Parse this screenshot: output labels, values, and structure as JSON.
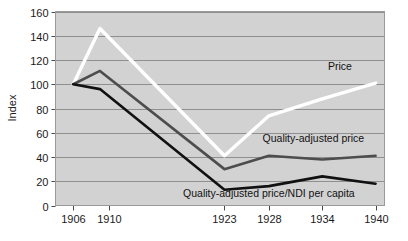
{
  "chart_data": {
    "type": "line",
    "title": "",
    "subtitle": "",
    "xlabel": "",
    "ylabel": "Index",
    "x": [
      1906,
      1910,
      1923,
      1928,
      1934,
      1940
    ],
    "xtick_labels": [
      "1906",
      "1910",
      "1923",
      "1928",
      "1934",
      "1940"
    ],
    "ytick_labels": [
      "0",
      "20",
      "40",
      "60",
      "80",
      "100",
      "120",
      "140",
      "160"
    ],
    "yticks": [
      0,
      20,
      40,
      60,
      80,
      100,
      120,
      140,
      160
    ],
    "xlim": [
      1904,
      1941
    ],
    "ylim": [
      0,
      160
    ],
    "grid": "horizontal",
    "legend_position": "inline-annotations",
    "plot_background": "#d2d2d2",
    "figure_background": "#ffffff",
    "series": [
      {
        "name": "Price",
        "color": "#ffffff",
        "values": [
          100,
          146,
          41,
          74,
          88,
          101
        ],
        "peak_x": 1909,
        "annotation": "Price"
      },
      {
        "name": "Quality-adjusted price",
        "color": "#4d4d4d",
        "values": [
          100,
          111,
          30,
          41,
          38,
          41
        ],
        "peak_x": 1909,
        "annotation": "Quality-adjusted price"
      },
      {
        "name": "Quality-adjusted price/NDI per capita",
        "color": "#111111",
        "values": [
          100,
          96,
          13,
          16,
          24,
          18
        ],
        "peak_x": 1909,
        "annotation": "Quality-adjusted price/NDI per capita"
      }
    ],
    "annotations": [
      {
        "text": "Price",
        "x": 1936,
        "y": 112
      },
      {
        "text": "Quality-adjusted price",
        "x": 1933,
        "y": 52
      },
      {
        "text": "Quality-adjusted price/NDI per capita",
        "x": 1928,
        "y": 7
      }
    ]
  },
  "axes": {
    "y_title": "Index",
    "y_ticks": [
      "160",
      "140",
      "120",
      "100",
      "80",
      "60",
      "40",
      "20",
      "0"
    ],
    "x_ticks": [
      "1906",
      "1910",
      "1923",
      "1928",
      "1934",
      "1940"
    ]
  },
  "labels": {
    "price": "Price",
    "quality_adjusted_price": "Quality-adjusted price",
    "quality_adjusted_price_ndi": "Quality-adjusted price/NDI per capita"
  },
  "colors": {
    "plot_bg": "#d2d2d2",
    "grid": "#8f8f8f",
    "axis": "#4a4a4a",
    "price_line": "#ffffff",
    "qap_line": "#4d4d4d",
    "qapndi_line": "#111111",
    "text": "#1a1a1a"
  }
}
